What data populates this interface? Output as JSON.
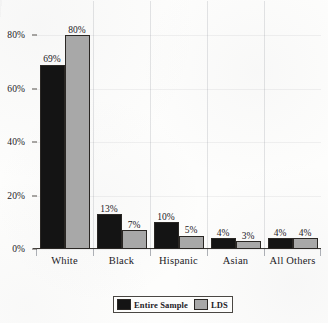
{
  "chart_data": {
    "type": "bar",
    "title": "",
    "subtitle": "",
    "xlabel": "",
    "ylabel": "",
    "categories": [
      "White",
      "Black",
      "Hispanic",
      "Asian",
      "All Others"
    ],
    "series": [
      {
        "name": "Entire Sample",
        "color": "#141414",
        "values": [
          69,
          13,
          10,
          4,
          4
        ],
        "value_labels": [
          "69%",
          "13%",
          "10%",
          "4%",
          "4%"
        ]
      },
      {
        "name": "LDS",
        "color": "#a8a8a8",
        "values": [
          80,
          7,
          5,
          3,
          4
        ],
        "value_labels": [
          "80%",
          "7%",
          "5%",
          "3%",
          "4%"
        ]
      }
    ],
    "ylim": [
      0,
      85
    ],
    "yticks": [
      0,
      20,
      40,
      60,
      80
    ],
    "ytick_labels": [
      "0%",
      "20%",
      "40%",
      "60%",
      "80%"
    ],
    "grid": "vertical category separators, faint",
    "legend_position": "bottom-center"
  },
  "legend": {
    "items": [
      {
        "label": "Entire Sample",
        "color": "#141414"
      },
      {
        "label": "LDS",
        "color": "#a8a8a8"
      }
    ]
  }
}
